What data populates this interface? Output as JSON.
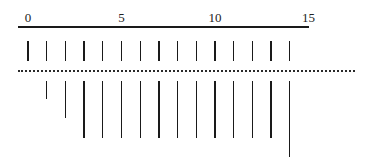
{
  "figure": {
    "title": "",
    "scale_labels": [
      {
        "text": "0",
        "value": 0
      },
      {
        "text": "5",
        "value": 5
      },
      {
        "text": "10",
        "value": 10
      },
      {
        "text": "15",
        "value": 15
      }
    ],
    "scale": {
      "min": 0,
      "max": 15.5,
      "unit_px": 18.7,
      "origin_x": 28
    },
    "top_ticks": {
      "positions": [
        0,
        1,
        2,
        3,
        4,
        5,
        6,
        7,
        8,
        9,
        10,
        11,
        12,
        13,
        14
      ],
      "y_top": 41,
      "y_bottom": 61
    },
    "bottom_ticks": [
      {
        "pos": 1,
        "length": 18
      },
      {
        "pos": 2,
        "length": 37
      },
      {
        "pos": 3,
        "length": 57
      },
      {
        "pos": 4,
        "length": 57
      },
      {
        "pos": 5,
        "length": 57
      },
      {
        "pos": 6,
        "length": 57
      },
      {
        "pos": 7,
        "length": 57
      },
      {
        "pos": 8,
        "length": 57
      },
      {
        "pos": 9,
        "length": 57
      },
      {
        "pos": 10,
        "length": 57
      },
      {
        "pos": 11,
        "length": 57
      },
      {
        "pos": 12,
        "length": 57
      },
      {
        "pos": 13,
        "length": 57
      },
      {
        "pos": 14,
        "length": 76
      }
    ],
    "colors": {
      "ink": "#1a1a1a",
      "background": "#ffffff"
    }
  }
}
